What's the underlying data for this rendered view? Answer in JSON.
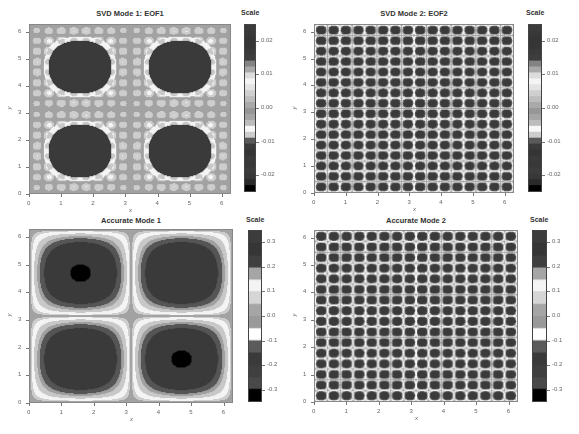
{
  "chart_data": [
    {
      "type": "heatmap",
      "title": "SVD Mode 1: EOF1",
      "xlabel": "x",
      "ylabel": "y",
      "xlim": [
        0,
        6.283
      ],
      "ylim": [
        0,
        6.283
      ],
      "xticks": [
        "0",
        "1",
        "2",
        "3",
        "4",
        "5",
        "6"
      ],
      "yticks": [
        "0",
        "1",
        "2",
        "3",
        "4",
        "5",
        "6"
      ],
      "colorbar": {
        "title": "Scale",
        "ticks": [
          "0.02",
          "0.01",
          "0.00",
          "-0.01",
          "-0.02"
        ],
        "tick_values": [
          0.02,
          0.01,
          0.0,
          -0.01,
          -0.02
        ],
        "range": [
          -0.025,
          0.025
        ]
      },
      "pattern": "eof1",
      "description": "Four blob-shaped dark regions centered near (1.5,4.7),(4.7,4.7),(1.5,1.6),(4.7,1.6) with white rings and grey background"
    },
    {
      "type": "heatmap",
      "title": "SVD Mode 2: EOF2",
      "xlabel": "x",
      "ylabel": "y",
      "xlim": [
        0,
        6.283
      ],
      "ylim": [
        0,
        6.283
      ],
      "xticks": [
        "0",
        "1",
        "2",
        "3",
        "4",
        "5",
        "6"
      ],
      "yticks": [
        "0",
        "1",
        "2",
        "3",
        "4",
        "5",
        "6"
      ],
      "colorbar": {
        "title": "Scale",
        "ticks": [
          "0.02",
          "0.01",
          "0.00",
          "-0.01",
          "-0.02"
        ],
        "tick_values": [
          0.02,
          0.01,
          0.0,
          -0.01,
          -0.02
        ],
        "range": [
          -0.025,
          0.025
        ]
      },
      "pattern": "eof2",
      "grid_cells": 16,
      "description": "16x16 checkerboard of dark dots with white rings"
    },
    {
      "type": "heatmap",
      "title": "Accurate Mode 1",
      "xlabel": "x",
      "ylabel": "y",
      "xlim": [
        0,
        6.283
      ],
      "ylim": [
        0,
        6.283
      ],
      "xticks": [
        "0",
        "1",
        "2",
        "3",
        "4",
        "5",
        "6"
      ],
      "yticks": [
        "0",
        "1",
        "2",
        "3",
        "4",
        "5",
        "6"
      ],
      "colorbar": {
        "title": "Scale",
        "ticks": [
          "0.3",
          "0.2",
          "0.1",
          "0.0",
          "-0.1",
          "-0.2",
          "-0.3"
        ],
        "tick_values": [
          0.3,
          0.2,
          0.1,
          0.0,
          -0.1,
          -0.2,
          -0.3
        ],
        "range": [
          -0.35,
          0.35
        ]
      },
      "pattern": "acc1",
      "description": "sin(x)sin(y)-like field: four rounded-square lobes with black cores at (1.57,4.71) and (4.71,1.57)"
    },
    {
      "type": "heatmap",
      "title": "Accurate Mode 2",
      "xlabel": "x",
      "ylabel": "y",
      "xlim": [
        0,
        6.283
      ],
      "ylim": [
        0,
        6.283
      ],
      "xticks": [
        "0",
        "1",
        "2",
        "3",
        "4",
        "5",
        "6"
      ],
      "yticks": [
        "0",
        "1",
        "2",
        "3",
        "4",
        "5",
        "6"
      ],
      "colorbar": {
        "title": "Scale",
        "ticks": [
          "0.3",
          "0.2",
          "0.1",
          "0.0",
          "-0.1",
          "-0.2",
          "-0.3"
        ],
        "tick_values": [
          0.3,
          0.2,
          0.1,
          0.0,
          -0.1,
          -0.2,
          -0.3
        ],
        "range": [
          -0.35,
          0.35
        ]
      },
      "pattern": "acc2",
      "grid_cells": 16,
      "description": "regular 16x16 array of dark dots with white rings"
    }
  ],
  "panels": [
    {
      "title": "SVD Mode 1: EOF1",
      "scale_title": "Scale",
      "xlabel": "x",
      "ylabel": "y"
    },
    {
      "title": "SVD Mode 2: EOF2",
      "scale_title": "Scale",
      "xlabel": "x",
      "ylabel": "y"
    },
    {
      "title": "Accurate Mode 1",
      "scale_title": "Scale",
      "xlabel": "x",
      "ylabel": "y"
    },
    {
      "title": "Accurate Mode 2",
      "scale_title": "Scale",
      "xlabel": "x",
      "ylabel": "y"
    }
  ],
  "colors": {
    "background": "#a2a2a2",
    "dark": "#3a3a3a",
    "darkest": "#000000",
    "light": "#f4f4f4",
    "mid": "#c8c8c8",
    "axis": "#888888"
  },
  "colorbar_bands_eof": [
    "#3b3b3b",
    "#383838",
    "#353535",
    "#363636",
    "#3a3a3a",
    "#3e3e3e",
    "#838383",
    "#a9a9a9",
    "#dcdcdc",
    "#f4f4f4",
    "#e3e3e3",
    "#cfcfcf",
    "#bdbdbd",
    "#a9a9a9",
    "#979797",
    "#a5a5a5",
    "#bcbcbc",
    "#f7f7f7",
    "#cdcdcd",
    "#5a5a5a",
    "#3b3b3b",
    "#353535",
    "#3a3a3a",
    "#383838",
    "#3c3c3c",
    "#383838",
    "#2a2a2a",
    "#000000"
  ],
  "colorbar_bands_acc": [
    "#3c3c3c",
    "#363636",
    "#3f3f3f",
    "#a5a5a5",
    "#f4f4f4",
    "#d6d6d6",
    "#a5a5a5",
    "#9a9a9a",
    "#ffffff",
    "#5b5b5b",
    "#3a3a3a",
    "#3f3f3f",
    "#494949",
    "#000000"
  ]
}
